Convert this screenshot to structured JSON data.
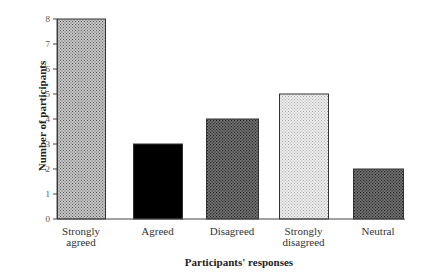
{
  "chart_data": {
    "type": "bar",
    "title": "",
    "xlabel": "Participants' responses",
    "ylabel": "Number of participants",
    "ylim": [
      0,
      8
    ],
    "yticks": [
      0,
      1,
      2,
      3,
      4,
      5,
      6,
      7,
      8
    ],
    "grid": false,
    "legend": null,
    "categories": [
      "Strongly agreed",
      "Agreed",
      "Disagreed",
      "Strongly disagreed",
      "Neutral"
    ],
    "category_lines": [
      [
        "Strongly",
        "agreed"
      ],
      [
        "Agreed"
      ],
      [
        "Disagreed"
      ],
      [
        "Strongly",
        "disagreed"
      ],
      [
        "Neutral"
      ]
    ],
    "values": [
      8,
      3,
      4,
      5,
      2
    ],
    "fills": [
      "medium-gray-dotted",
      "black-solid",
      "dark-gray-dotted",
      "light-gray-dotted",
      "dark-gray-dotted"
    ]
  }
}
